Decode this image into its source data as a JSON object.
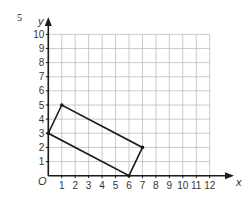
{
  "question_number": "5",
  "chart_data": {
    "type": "line",
    "title": "",
    "xlabel": "x",
    "ylabel": "y",
    "origin_label": "O",
    "xlim": [
      0,
      12
    ],
    "ylim": [
      0,
      10
    ],
    "grid": true,
    "x_ticks": [
      "1",
      "2",
      "3",
      "4",
      "5",
      "6",
      "7",
      "8",
      "9",
      "10",
      "11",
      "12"
    ],
    "y_ticks": [
      "1",
      "2",
      "3",
      "4",
      "5",
      "6",
      "7",
      "8",
      "9",
      "10"
    ],
    "series": [
      {
        "name": "quadrilateral",
        "closed": true,
        "points": [
          [
            0,
            3
          ],
          [
            1,
            5
          ],
          [
            7,
            2
          ],
          [
            6,
            0
          ]
        ]
      }
    ]
  },
  "colors": {
    "grid": "#bdbdbd",
    "axis": "#1a1a1a",
    "shape": "#1a1a1a",
    "text": "#333333"
  }
}
